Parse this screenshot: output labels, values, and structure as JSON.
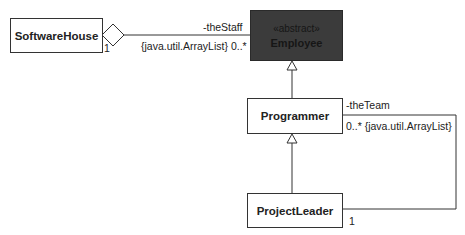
{
  "diagram": {
    "type": "uml-class-diagram",
    "classes": [
      {
        "id": "software_house",
        "name": "SoftwareHouse",
        "stereotype": null
      },
      {
        "id": "employee",
        "name": "Employee",
        "stereotype": "«abstract»"
      },
      {
        "id": "programmer",
        "name": "Programmer",
        "stereotype": null
      },
      {
        "id": "project_leader",
        "name": "ProjectLeader",
        "stereotype": null
      }
    ],
    "relations": [
      {
        "kind": "aggregation",
        "from": "SoftwareHouse",
        "to": "Employee",
        "source_multiplicity": "1",
        "role": "-theStaff",
        "target_constraint": "{java.util.ArrayList} 0..*"
      },
      {
        "kind": "generalization",
        "from": "Programmer",
        "to": "Employee"
      },
      {
        "kind": "generalization",
        "from": "ProjectLeader",
        "to": "Programmer"
      },
      {
        "kind": "association",
        "from": "ProjectLeader",
        "to": "Programmer",
        "source_multiplicity": "1",
        "role": "-theTeam",
        "target_constraint": "0..* {java.util.ArrayList}"
      }
    ]
  },
  "labels": {
    "staff_role": "-theStaff",
    "staff_constraint": "{java.util.ArrayList} 0..*",
    "house_multiplicity": "1",
    "team_role": "-theTeam",
    "team_constraint": "0..* {java.util.ArrayList}",
    "leader_multiplicity": "1"
  }
}
